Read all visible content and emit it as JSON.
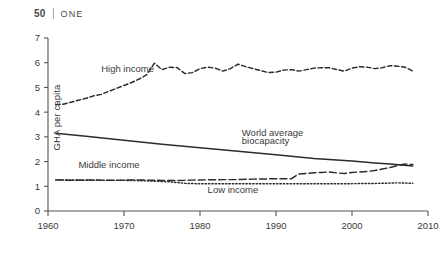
{
  "running_head": {
    "folio": "50",
    "separator": "|",
    "chapter": "ONE"
  },
  "colors": {
    "ink": "#3a3a38",
    "line": "#2b2b2b",
    "axis": "#55544f",
    "background": "#ffffff"
  },
  "chart_data": {
    "type": "line",
    "title": "",
    "xlabel": "",
    "ylabel": "GHA per capita",
    "xlim": [
      1960,
      2010
    ],
    "ylim": [
      0,
      7
    ],
    "xticks": [
      1960,
      1970,
      1980,
      1990,
      2000,
      2010
    ],
    "yticks": [
      0,
      1,
      2,
      3,
      4,
      5,
      6,
      7
    ],
    "grid": false,
    "legend_position": "inline-annotations",
    "annotations": [
      {
        "text": "High income",
        "x": 1967.0,
        "y": 5.62
      },
      {
        "text": "World average",
        "x": 1985.5,
        "y": 3.02
      },
      {
        "text": "biocapacity",
        "x": 1985.5,
        "y": 2.72
      },
      {
        "text": "Middle income",
        "x": 1964.0,
        "y": 1.72
      },
      {
        "text": "Low income",
        "x": 1981.0,
        "y": 0.74
      }
    ],
    "series": [
      {
        "name": "High income",
        "style": "dashed",
        "x": [
          1961,
          1962,
          1963,
          1964,
          1965,
          1966,
          1967,
          1968,
          1969,
          1970,
          1971,
          1972,
          1973,
          1974,
          1975,
          1976,
          1977,
          1978,
          1979,
          1980,
          1981,
          1982,
          1983,
          1984,
          1985,
          1986,
          1987,
          1988,
          1989,
          1990,
          1991,
          1992,
          1993,
          1994,
          1995,
          1996,
          1997,
          1998,
          1999,
          2000,
          2001,
          2002,
          2003,
          2004,
          2005,
          2006,
          2007,
          2008
        ],
        "values": [
          4.3,
          4.32,
          4.4,
          4.48,
          4.56,
          4.66,
          4.72,
          4.84,
          4.96,
          5.08,
          5.2,
          5.34,
          5.52,
          5.98,
          5.72,
          5.82,
          5.8,
          5.56,
          5.6,
          5.76,
          5.82,
          5.78,
          5.66,
          5.76,
          5.94,
          5.84,
          5.76,
          5.68,
          5.6,
          5.62,
          5.7,
          5.72,
          5.66,
          5.72,
          5.78,
          5.8,
          5.8,
          5.72,
          5.66,
          5.78,
          5.84,
          5.82,
          5.76,
          5.8,
          5.88,
          5.86,
          5.82,
          5.66
        ]
      },
      {
        "name": "World average biocapacity",
        "style": "solid",
        "x": [
          1961,
          1965,
          1970,
          1975,
          1980,
          1985,
          1990,
          1992,
          1995,
          2000,
          2003,
          2005,
          2008
        ],
        "values": [
          3.15,
          3.02,
          2.86,
          2.7,
          2.56,
          2.42,
          2.28,
          2.22,
          2.12,
          2.02,
          1.94,
          1.9,
          1.82
        ]
      },
      {
        "name": "Middle income",
        "style": "long-dashed",
        "x": [
          1961,
          1963,
          1965,
          1967,
          1969,
          1971,
          1973,
          1975,
          1977,
          1979,
          1981,
          1983,
          1985,
          1987,
          1989,
          1991,
          1992,
          1993,
          1994,
          1995,
          1996,
          1997,
          1998,
          1999,
          2000,
          2001,
          2002,
          2003,
          2004,
          2005,
          2006,
          2007,
          2008
        ],
        "values": [
          1.26,
          1.24,
          1.26,
          1.25,
          1.24,
          1.26,
          1.25,
          1.24,
          1.23,
          1.25,
          1.26,
          1.27,
          1.27,
          1.29,
          1.3,
          1.31,
          1.3,
          1.5,
          1.52,
          1.55,
          1.56,
          1.58,
          1.54,
          1.52,
          1.56,
          1.58,
          1.6,
          1.64,
          1.7,
          1.76,
          1.84,
          1.9,
          1.88
        ]
      },
      {
        "name": "Low income",
        "style": "dotted",
        "x": [
          1961,
          1964,
          1967,
          1970,
          1973,
          1976,
          1978,
          1980,
          1983,
          1986,
          1989,
          1992,
          1995,
          1998,
          2001,
          2004,
          2006,
          2008
        ],
        "values": [
          1.26,
          1.25,
          1.24,
          1.24,
          1.22,
          1.18,
          1.12,
          1.1,
          1.1,
          1.1,
          1.1,
          1.1,
          1.1,
          1.1,
          1.11,
          1.12,
          1.14,
          1.12
        ]
      }
    ]
  }
}
